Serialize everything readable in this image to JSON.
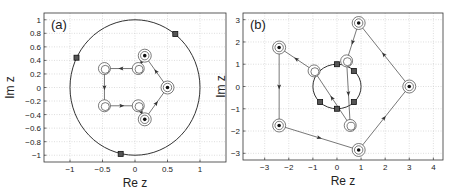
{
  "chart_data": [
    {
      "type": "scatter",
      "panel_label": "(a)",
      "title": "",
      "xlabel": "Re z",
      "ylabel": "Im z",
      "xlim": [
        -1.4,
        1.4
      ],
      "ylim": [
        -1.1,
        1.1
      ],
      "xticks": [
        -1,
        -0.5,
        0,
        0.5,
        1
      ],
      "xtick_labels": [
        "−1",
        "−0.5",
        "0",
        "0.5",
        "1"
      ],
      "yticks": [
        -1,
        -0.8,
        -0.6,
        -0.4,
        -0.2,
        0,
        0.2,
        0.4,
        0.6,
        0.8,
        1
      ],
      "ytick_labels": [
        "−1",
        "−0.8",
        "−0.6",
        "−0.4",
        "−0.2",
        "0",
        "0.2",
        "0.4",
        "0.6",
        "0.8",
        "1"
      ],
      "grid": true,
      "unit_circle": {
        "center": [
          0,
          0
        ],
        "radius": 1
      },
      "square_markers": [
        [
          0.62,
          0.79
        ],
        [
          -0.9,
          0.44
        ],
        [
          -0.22,
          -0.98
        ]
      ],
      "filled_targets": [
        [
          0.15,
          0.47
        ],
        [
          0.5,
          0
        ],
        [
          0.15,
          -0.47
        ]
      ],
      "open_circles": [
        [
          0.05,
          0.28
        ],
        [
          -0.47,
          0.28
        ],
        [
          -0.47,
          -0.27
        ],
        [
          0.05,
          -0.27
        ]
      ],
      "trajectory": [
        [
          0.5,
          0
        ],
        [
          0.15,
          0.47
        ],
        [
          0.05,
          0.28
        ],
        [
          -0.47,
          0.28
        ],
        [
          -0.47,
          -0.27
        ],
        [
          0.05,
          -0.27
        ],
        [
          0.15,
          -0.47
        ],
        [
          0.5,
          0
        ]
      ]
    },
    {
      "type": "scatter",
      "panel_label": "(b)",
      "title": "",
      "xlabel": "Re z",
      "ylabel": "Im z",
      "xlim": [
        -3.9,
        4.4
      ],
      "ylim": [
        -3.3,
        3.3
      ],
      "xticks": [
        -3,
        -2,
        -1,
        0,
        1,
        2,
        3,
        4
      ],
      "xtick_labels": [
        "−3",
        "−2",
        "−1",
        "0",
        "1",
        "2",
        "3",
        "4"
      ],
      "yticks": [
        -3,
        -2,
        -1,
        0,
        1,
        2,
        3
      ],
      "ytick_labels": [
        "−3",
        "−2",
        "−1",
        "0",
        "1",
        "2",
        "3"
      ],
      "grid": true,
      "unit_circle": {
        "center": [
          0,
          0
        ],
        "radius": 1
      },
      "square_markers": [
        [
          0,
          1
        ],
        [
          0.7,
          0.7
        ],
        [
          0.7,
          -0.7
        ],
        [
          0,
          -1
        ],
        [
          -0.7,
          -0.7
        ]
      ],
      "filled_targets": [
        [
          0.9,
          2.85
        ],
        [
          3,
          0
        ],
        [
          0.9,
          -2.85
        ],
        [
          -2.4,
          -1.75
        ],
        [
          -2.4,
          1.75
        ]
      ],
      "open_circles": [
        [
          0.4,
          1.15
        ],
        [
          -0.95,
          0.7
        ],
        [
          0.55,
          -1.75
        ]
      ],
      "trajectory": [
        [
          0.9,
          2.85
        ],
        [
          0.4,
          1.15
        ],
        [
          0.55,
          -1.75
        ],
        [
          -0.95,
          0.7
        ],
        [
          -2.4,
          1.75
        ],
        [
          -2.4,
          -1.75
        ],
        [
          0.9,
          -2.85
        ],
        [
          3,
          0
        ],
        [
          0.9,
          2.85
        ]
      ]
    }
  ]
}
